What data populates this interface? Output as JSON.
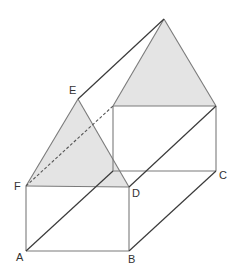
{
  "diagram": {
    "labels": {
      "A": "A",
      "B": "B",
      "C": "C",
      "D": "D",
      "E": "E",
      "F": "F"
    },
    "shade_color": "#e4e4e4",
    "edge_color": "#7a7a7a",
    "diagonal_color": "#3a3a3a"
  }
}
